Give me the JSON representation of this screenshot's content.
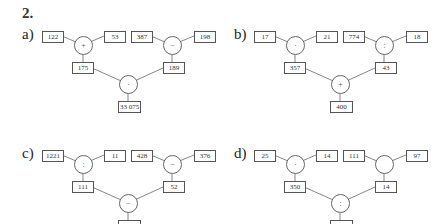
{
  "exercise_number": "2.",
  "panels": [
    {
      "label": "a)",
      "left_inputs": [
        "122",
        "53"
      ],
      "left_op": "+",
      "left_result": "175",
      "right_inputs": [
        "387",
        "198"
      ],
      "right_op": "−",
      "right_result": "189",
      "bottom_op": "·",
      "final_result": "33 075"
    },
    {
      "label": "b)",
      "left_inputs": [
        "17",
        "21"
      ],
      "left_op": "·",
      "left_result": "357",
      "right_inputs": [
        "774",
        "18"
      ],
      "right_op": ":",
      "right_result": "43",
      "bottom_op": "+",
      "final_result": "400"
    },
    {
      "label": "c)",
      "left_inputs": [
        "1221",
        "11"
      ],
      "left_op": ":",
      "left_result": "111",
      "right_inputs": [
        "428",
        "376"
      ],
      "right_op": "−",
      "right_result": "52",
      "bottom_op": "−",
      "final_result": "59"
    },
    {
      "label": "d)",
      "left_inputs": [
        "25",
        "14"
      ],
      "left_op": "·",
      "left_result": "350",
      "right_inputs": [
        "111",
        "97"
      ],
      "right_op": "",
      "right_result": "14",
      "bottom_op": ":",
      "final_result": "25"
    }
  ]
}
